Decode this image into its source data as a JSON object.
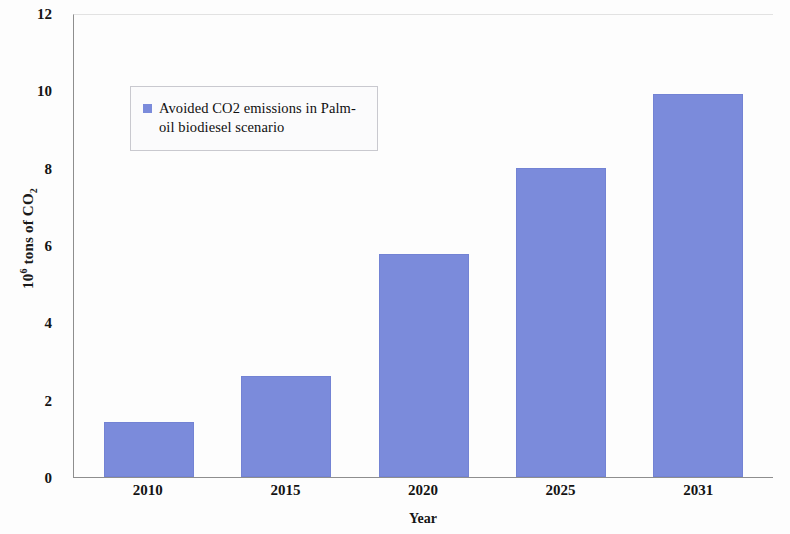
{
  "chart_data": {
    "type": "bar",
    "title": "",
    "categories": [
      "2010",
      "2015",
      "2020",
      "2025",
      "2031"
    ],
    "values": [
      1.42,
      2.62,
      5.76,
      8.0,
      9.9
    ],
    "series": [
      {
        "name": "Avoided CO2 emissions in Palm-oil biodiesel scenario",
        "values": [
          1.42,
          2.62,
          5.76,
          8.0,
          9.9
        ]
      }
    ],
    "xlabel": "Year",
    "ylabel": "106 tons of CO2",
    "ylabel_parts": {
      "base": "10",
      "exponent": "6",
      "middle": " tons of CO",
      "subscript": "2"
    },
    "ylim": [
      0,
      12
    ],
    "ytick_labels": [
      "12",
      "10",
      "8",
      "6",
      "4",
      "2",
      "0"
    ],
    "ytick_values": [
      12,
      10,
      8,
      6,
      4,
      2,
      0
    ],
    "grid": false,
    "legend_position": "upper-left-inside",
    "bar_color": "#7b8bdb",
    "axis_color": "#8e8e8e",
    "text_color": "#141414",
    "background_color": "#fdfdfd"
  },
  "legend": {
    "entries": [
      {
        "label": "Avoided CO2 emissions in Palm-oil biodiesel scenario",
        "color": "#7b8bdb"
      }
    ]
  }
}
